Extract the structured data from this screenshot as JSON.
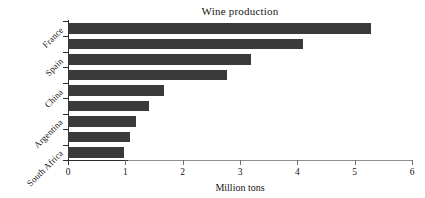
{
  "chart_data": {
    "type": "bar",
    "orientation": "horizontal",
    "title": "Wine production",
    "xlabel": "Million tons",
    "ylabel": "",
    "xlim": [
      0,
      6
    ],
    "ylim": [
      0,
      9
    ],
    "grid": false,
    "legend": null,
    "bar_color": "#3a3a3a",
    "categories": [
      "France",
      "",
      "Spain",
      "",
      "China",
      "",
      "Argentina",
      "",
      "South Africa"
    ],
    "visible_tick_labels": [
      "France",
      "Spain",
      "China",
      "Argentina",
      "South Africa"
    ],
    "values": [
      5.29,
      4.1,
      3.19,
      2.77,
      1.68,
      1.41,
      1.19,
      1.08,
      0.98
    ],
    "xticks": [
      0,
      1,
      2,
      3,
      4,
      5,
      6
    ],
    "xticklabels": [
      "0",
      "1",
      "2",
      "3",
      "4",
      "5",
      "6"
    ],
    "bars": [
      {
        "label": "France",
        "value": 5.29,
        "tick_label": "France"
      },
      {
        "label": "",
        "value": 4.1,
        "tick_label": ""
      },
      {
        "label": "Spain",
        "value": 3.19,
        "tick_label": "Spain"
      },
      {
        "label": "",
        "value": 2.77,
        "tick_label": ""
      },
      {
        "label": "China",
        "value": 1.68,
        "tick_label": "China"
      },
      {
        "label": "",
        "value": 1.41,
        "tick_label": ""
      },
      {
        "label": "Argentina",
        "value": 1.19,
        "tick_label": "Argentina"
      },
      {
        "label": "",
        "value": 1.08,
        "tick_label": ""
      },
      {
        "label": "South Africa",
        "value": 0.98,
        "tick_label": "South Africa"
      }
    ]
  }
}
